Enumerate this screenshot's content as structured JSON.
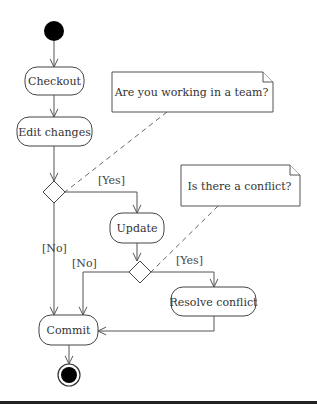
{
  "diagram": {
    "type": "uml-activity-diagram",
    "width": 317,
    "height": 409,
    "colors": {
      "line": "#555555",
      "node_fill": "#000000",
      "background": "#ffffff",
      "rule": "#222222"
    },
    "start_node": {
      "id": "start",
      "cx": 54,
      "cy": 31,
      "r": 10
    },
    "end_node": {
      "id": "end",
      "cx": 69,
      "cy": 375,
      "r_outer": 11,
      "r_inner": 8
    },
    "actions": [
      {
        "id": "checkout",
        "label": "Checkout",
        "x": 25,
        "y": 67,
        "w": 59,
        "h": 28
      },
      {
        "id": "edit-changes",
        "label": "Edit changes",
        "x": 17,
        "y": 117,
        "w": 75,
        "h": 29
      },
      {
        "id": "update",
        "label": "Update",
        "x": 110,
        "y": 213,
        "w": 54,
        "h": 30
      },
      {
        "id": "resolve-conflict",
        "label": "Resolve conflict",
        "x": 171,
        "y": 287,
        "w": 85,
        "h": 29
      },
      {
        "id": "commit",
        "label": "Commit",
        "x": 39,
        "y": 315,
        "w": 59,
        "h": 30
      }
    ],
    "decisions": [
      {
        "id": "decision-team",
        "cx": 54,
        "cy": 192,
        "half": 11
      },
      {
        "id": "decision-conflict",
        "cx": 140,
        "cy": 272,
        "half": 11
      }
    ],
    "notes": [
      {
        "id": "note-team",
        "label": "Are you working in a team?",
        "x": 112,
        "y": 72,
        "w": 161,
        "h": 40,
        "fold": 10
      },
      {
        "id": "note-conflict",
        "label": "Is there a conflict?",
        "x": 181,
        "y": 165,
        "w": 119,
        "h": 41,
        "fold": 10
      }
    ],
    "guards": [
      {
        "id": "guard-team-yes",
        "label": "[Yes]",
        "x": 98,
        "y": 184
      },
      {
        "id": "guard-team-no",
        "label": "[No]",
        "x": 42,
        "y": 252
      },
      {
        "id": "guard-conflict-no",
        "label": "[No]",
        "x": 72,
        "y": 267
      },
      {
        "id": "guard-conflict-yes",
        "label": "[Yes]",
        "x": 176,
        "y": 264
      }
    ],
    "edges": [
      {
        "from": "start",
        "to": "checkout",
        "points": [
          [
            54,
            41
          ],
          [
            54,
            67
          ]
        ]
      },
      {
        "from": "checkout",
        "to": "edit-changes",
        "points": [
          [
            54,
            95
          ],
          [
            54,
            117
          ]
        ]
      },
      {
        "from": "edit-changes",
        "to": "decision-team",
        "points": [
          [
            54,
            146
          ],
          [
            54,
            181
          ]
        ]
      },
      {
        "from": "decision-team",
        "to": "update",
        "guard": "[Yes]",
        "points": [
          [
            65,
            192
          ],
          [
            137,
            192
          ],
          [
            137,
            213
          ]
        ]
      },
      {
        "from": "decision-team",
        "to": "commit",
        "guard": "[No]",
        "points": [
          [
            54,
            203
          ],
          [
            54,
            315
          ]
        ]
      },
      {
        "from": "update",
        "to": "decision-conflict",
        "points": [
          [
            137,
            243
          ],
          [
            137,
            261
          ]
        ]
      },
      {
        "from": "decision-conflict",
        "to": "commit",
        "guard": "[No]",
        "points": [
          [
            129,
            272
          ],
          [
            83,
            272
          ],
          [
            83,
            315
          ]
        ]
      },
      {
        "from": "decision-conflict",
        "to": "resolve-conflict",
        "guard": "[Yes]",
        "points": [
          [
            151,
            272
          ],
          [
            214,
            272
          ],
          [
            214,
            287
          ]
        ]
      },
      {
        "from": "resolve-conflict",
        "to": "commit",
        "points": [
          [
            214,
            316
          ],
          [
            214,
            331
          ],
          [
            98,
            331
          ]
        ]
      },
      {
        "from": "commit",
        "to": "end",
        "points": [
          [
            69,
            345
          ],
          [
            69,
            364
          ]
        ]
      }
    ],
    "anchors": [
      {
        "note": "note-team",
        "target": "decision-team",
        "points": [
          [
            167,
            112
          ],
          [
            65,
            192
          ]
        ]
      },
      {
        "note": "note-conflict",
        "target": "decision-conflict",
        "points": [
          [
            218,
            206
          ],
          [
            151,
            272
          ]
        ]
      }
    ],
    "bottom_rule": {
      "y": 402,
      "thickness": 3
    }
  }
}
